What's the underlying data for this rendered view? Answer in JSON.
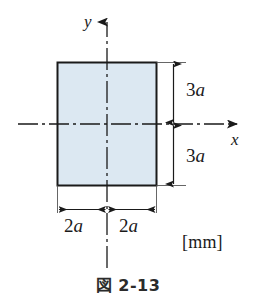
{
  "figure": {
    "caption": "図 2-13",
    "unit_label": "[mm]",
    "background_color": "#ffffff",
    "line_color": "#1a1a1a",
    "shape": {
      "name": "rectangle",
      "fill_color": "#dce8f2",
      "stroke_color": "#1a1a1a",
      "width_expression": "4a",
      "height_expression": "6a"
    },
    "axes": {
      "x_label": "x",
      "y_label": "y",
      "x_axis_style": "dash-dot centerline with arrowhead",
      "y_axis_style": "dash-dot centerline with arrowhead",
      "origin_description": "centroid of rectangle"
    },
    "dimensions": [
      {
        "name": "height-upper",
        "label": "3a",
        "orientation": "vertical",
        "side": "right"
      },
      {
        "name": "height-lower",
        "label": "3a",
        "orientation": "vertical",
        "side": "right"
      },
      {
        "name": "width-left",
        "label": "2a",
        "orientation": "horizontal",
        "side": "bottom"
      },
      {
        "name": "width-right",
        "label": "2a",
        "orientation": "horizontal",
        "side": "bottom"
      }
    ]
  },
  "chart_data": {
    "type": "diagram",
    "title": "図 2-13",
    "subtitle": "",
    "xlabel": "x",
    "ylabel": "y",
    "units": "[mm]",
    "annotations": [
      "3a",
      "3a",
      "2a",
      "2a",
      "[mm]"
    ],
    "shapes": [
      {
        "type": "rectangle",
        "fill": "#dce8f2",
        "stroke": "#1a1a1a",
        "half_width": "2a",
        "half_height": "3a",
        "total_width": "4a",
        "total_height": "6a",
        "center": [
          0,
          0
        ]
      }
    ],
    "grid": false,
    "legend": "none"
  }
}
